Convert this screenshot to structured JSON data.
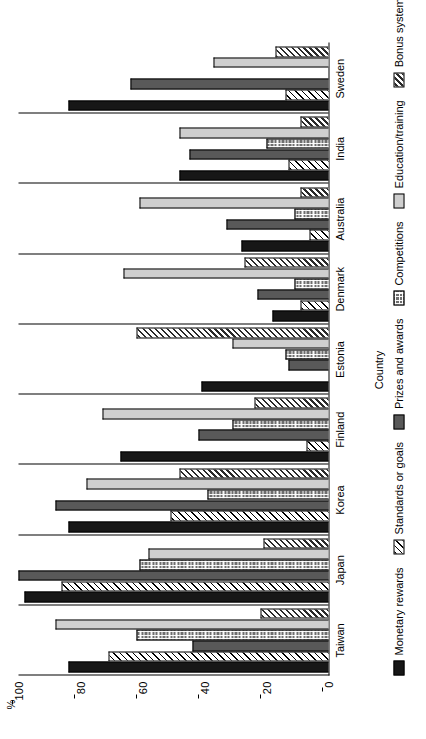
{
  "chart_data": {
    "type": "bar",
    "title": "",
    "orientation": "vertical-bars-on-rotated-page",
    "xlabel": "Country",
    "ylabel": "%",
    "ylim": [
      0,
      100
    ],
    "yticks": [
      0,
      20,
      40,
      60,
      80,
      100
    ],
    "ytick_labels": [
      "0",
      "20",
      "40",
      "60",
      "80",
      "100"
    ],
    "grid": false,
    "legend_position": "bottom",
    "categories": [
      "Taiwan",
      "Japan",
      "Korea",
      "Finland",
      "Estonia",
      "Denmark",
      "Australia",
      "India",
      "Sweden"
    ],
    "series": [
      {
        "name": "Monetary rewards",
        "color": "#171717",
        "pattern": "solid-black",
        "values": [
          84,
          98,
          84,
          67,
          41,
          18,
          28,
          48,
          84
        ]
      },
      {
        "name": "Standards or goals",
        "color": "#ffffff",
        "pattern": "diagonal-hatch-thin",
        "values": [
          71,
          86,
          51,
          7,
          0,
          9,
          6,
          13,
          14
        ]
      },
      {
        "name": "Prizes and awards",
        "color": "#595959",
        "pattern": "solid-dark-gray",
        "values": [
          44,
          100,
          88,
          42,
          13,
          23,
          33,
          45,
          64
        ]
      },
      {
        "name": "Competitions",
        "color": "#6e6e6e",
        "pattern": "checkerboard",
        "values": [
          62,
          61,
          39,
          31,
          14,
          11,
          11,
          20,
          0
        ]
      },
      {
        "name": "Education/training",
        "color": "#cfcfcf",
        "pattern": "solid-light-gray",
        "values": [
          88,
          58,
          78,
          73,
          31,
          66,
          61,
          48,
          37
        ]
      },
      {
        "name": "Bonus systems",
        "color": "#ffffff",
        "pattern": "diagonal-hatch-bold",
        "values": [
          22,
          21,
          48,
          24,
          62,
          27,
          9,
          9,
          17
        ]
      }
    ]
  }
}
